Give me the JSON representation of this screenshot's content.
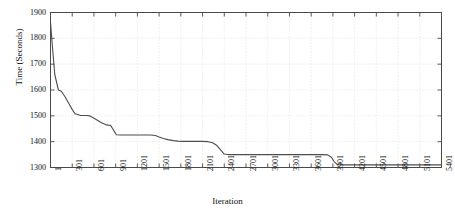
{
  "chart_data": {
    "type": "line",
    "title": "",
    "xlabel": "Iteration",
    "ylabel": "Time (Seconds)",
    "xlim": [
      1,
      5401
    ],
    "ylim": [
      1300,
      1900
    ],
    "grid": true,
    "legend": null,
    "y_ticks": [
      1300,
      1400,
      1500,
      1600,
      1700,
      1800,
      1900
    ],
    "y_tick_labels": [
      "1300",
      "1400",
      "1500",
      "1600",
      "1700",
      "1800",
      "1900"
    ],
    "x_ticks": [
      1,
      301,
      601,
      901,
      1201,
      1501,
      1801,
      2101,
      2401,
      2701,
      3001,
      3301,
      3601,
      3901,
      4201,
      4501,
      4801,
      5101,
      5401
    ],
    "x_tick_labels": [
      "1",
      "301",
      "601",
      "901",
      "1201",
      "1501",
      "1801",
      "2101",
      "2401",
      "2701",
      "3001",
      "3301",
      "3601",
      "3901",
      "4201",
      "4501",
      "4801",
      "5101",
      "5401"
    ],
    "series": [
      {
        "name": "Convergence",
        "color": "#4d4d4d",
        "x": [
          1,
          30,
          60,
          110,
          150,
          200,
          260,
          300,
          340,
          420,
          500,
          540,
          620,
          700,
          760,
          800,
          830,
          860,
          890,
          910,
          960,
          1100,
          1250,
          1380,
          1450,
          1500,
          1560,
          1620,
          1700,
          1760,
          1820,
          1900,
          2000,
          2100,
          2180,
          2240,
          2300,
          2350,
          2400,
          2450,
          2600,
          2800,
          3000,
          3200,
          3400,
          3600,
          3750,
          3830,
          3880,
          3920,
          3960,
          4000,
          4200,
          4500,
          4800,
          5101,
          5401
        ],
        "y": [
          1862,
          1760,
          1660,
          1600,
          1595,
          1575,
          1545,
          1525,
          1508,
          1501,
          1501,
          1500,
          1488,
          1474,
          1466,
          1464,
          1463,
          1450,
          1436,
          1427,
          1426,
          1426,
          1426,
          1426,
          1424,
          1418,
          1412,
          1408,
          1404,
          1402,
          1401,
          1401,
          1401,
          1401,
          1400,
          1396,
          1385,
          1368,
          1352,
          1350,
          1350,
          1350,
          1350,
          1350,
          1350,
          1350,
          1350,
          1349,
          1340,
          1322,
          1312,
          1310,
          1310,
          1310,
          1310,
          1310,
          1310
        ]
      }
    ]
  },
  "figure": {
    "background_color": "#ffffff",
    "axis_color": "#4a4a4a",
    "grid_color": "#d8d8d8",
    "line_color": "#4d4d4d"
  }
}
